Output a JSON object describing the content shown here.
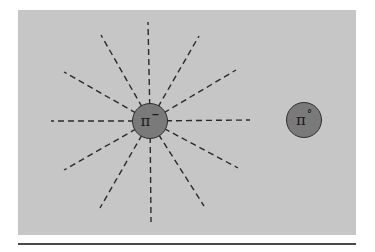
{
  "diagram": {
    "panel": {
      "background": "#c6c6c6"
    },
    "center": {
      "x": 150,
      "y": 121
    },
    "rays": [
      {
        "name": "up",
        "x2": 148,
        "y2": 22
      },
      {
        "name": "up-left-steep",
        "x2": 101,
        "y2": 35
      },
      {
        "name": "up-right-steep",
        "x2": 199,
        "y2": 36
      },
      {
        "name": "up-left-shallow",
        "x2": 64,
        "y2": 72
      },
      {
        "name": "up-right-shallow",
        "x2": 236,
        "y2": 70
      },
      {
        "name": "left",
        "x2": 51,
        "y2": 121
      },
      {
        "name": "right",
        "x2": 250,
        "y2": 120
      },
      {
        "name": "down-left-shallow",
        "x2": 64,
        "y2": 170
      },
      {
        "name": "down-right-shallow",
        "x2": 238,
        "y2": 168
      },
      {
        "name": "down-left-steep",
        "x2": 100,
        "y2": 208
      },
      {
        "name": "down-right-steep",
        "x2": 204,
        "y2": 206
      },
      {
        "name": "down",
        "x2": 151,
        "y2": 222
      }
    ],
    "ray_style": {
      "color": "#2a2a2a",
      "dash": "6 4",
      "width": 1.4
    },
    "particles": [
      {
        "id": "pi-minus",
        "symbol": "π",
        "superscript": "−",
        "label": "pi-minus",
        "fill": "#7a7a7a"
      },
      {
        "id": "pi-zero",
        "symbol": "π",
        "superscript": "°",
        "label": "pi-zero",
        "fill": "#7a7a7a"
      }
    ]
  }
}
